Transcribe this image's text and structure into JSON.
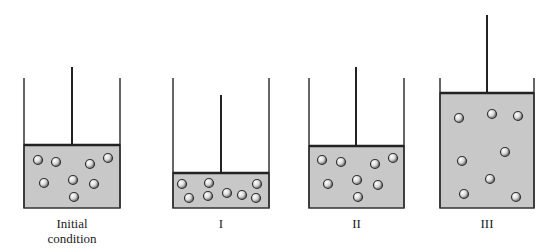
{
  "colors": {
    "wall": "#333333",
    "piston": "#222222",
    "gas_fill": "#c8c8c8",
    "particle_fill": "#d9d9d9",
    "particle_edge": "#333333"
  },
  "containers": [
    {
      "id": "initial",
      "label_line1": "Initial",
      "label_line2": "condition",
      "left": 24,
      "right": 120,
      "wall_top": 78,
      "bottom": 208,
      "piston_y": 145,
      "rod_x": 72,
      "rod_top": 67,
      "particles": [
        [
          38,
          160
        ],
        [
          56,
          162
        ],
        [
          90,
          164
        ],
        [
          108,
          158
        ],
        [
          44,
          183
        ],
        [
          73,
          180
        ],
        [
          94,
          184
        ],
        [
          74,
          197
        ]
      ]
    },
    {
      "id": "I",
      "label_line1": "I",
      "label_line2": "",
      "left": 173,
      "right": 269,
      "wall_top": 78,
      "bottom": 208,
      "piston_y": 173,
      "rod_x": 221,
      "rod_top": 95,
      "particles": [
        [
          182,
          184
        ],
        [
          189,
          198
        ],
        [
          209,
          183
        ],
        [
          208,
          196
        ],
        [
          227,
          193
        ],
        [
          242,
          195
        ],
        [
          257,
          184
        ],
        [
          256,
          198
        ]
      ]
    },
    {
      "id": "II",
      "label_line1": "II",
      "label_line2": "",
      "left": 309,
      "right": 404,
      "wall_top": 78,
      "bottom": 208,
      "piston_y": 146,
      "rod_x": 356,
      "rod_top": 67,
      "particles": [
        [
          322,
          160
        ],
        [
          341,
          162
        ],
        [
          375,
          164
        ],
        [
          393,
          158
        ],
        [
          328,
          184
        ],
        [
          357,
          180
        ],
        [
          378,
          185
        ],
        [
          358,
          197
        ]
      ]
    },
    {
      "id": "III",
      "label_line1": "III",
      "label_line2": "",
      "left": 440,
      "right": 534,
      "wall_top": 78,
      "bottom": 208,
      "piston_y": 93,
      "rod_x": 487,
      "rod_top": 15,
      "particles": [
        [
          459,
          118
        ],
        [
          492,
          114
        ],
        [
          518,
          116
        ],
        [
          462,
          161
        ],
        [
          505,
          152
        ],
        [
          490,
          179
        ],
        [
          464,
          194
        ],
        [
          516,
          197
        ]
      ]
    }
  ]
}
